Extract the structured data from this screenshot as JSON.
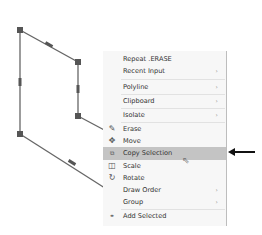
{
  "drawing": {
    "shape": "polyline-selected",
    "vertices": [
      [
        20,
        30
      ],
      [
        78,
        62
      ],
      [
        78,
        116
      ],
      [
        20,
        134
      ]
    ],
    "open_segments": [
      [
        [
          78,
          116
        ],
        [
          108,
          132
        ]
      ],
      [
        [
          20,
          134
        ],
        [
          108,
          190
        ]
      ]
    ],
    "line_color": "#666666",
    "grip_color": "#555555"
  },
  "menu": {
    "items": [
      {
        "label": "Repeat .ERASE",
        "icon": null,
        "submenu": false
      },
      {
        "label": "Recent Input",
        "icon": null,
        "submenu": true
      },
      {
        "label": "Polyline",
        "icon": null,
        "submenu": true
      },
      {
        "label": "Clipboard",
        "icon": null,
        "submenu": true
      },
      {
        "label": "Isolate",
        "icon": null,
        "submenu": true
      },
      {
        "label": "Erase",
        "icon": "eraser-icon",
        "submenu": false
      },
      {
        "label": "Move",
        "icon": "move-icon",
        "submenu": false
      },
      {
        "label": "Copy Selection",
        "icon": "copy-icon",
        "submenu": false,
        "highlighted": true
      },
      {
        "label": "Scale",
        "icon": "scale-icon",
        "submenu": false
      },
      {
        "label": "Rotate",
        "icon": "rotate-icon",
        "submenu": false
      },
      {
        "label": "Draw Order",
        "icon": null,
        "submenu": true
      },
      {
        "label": "Group",
        "icon": null,
        "submenu": true
      },
      {
        "label": "Add Selected",
        "icon": "add-selected-icon",
        "submenu": false
      }
    ],
    "submenu_glyph": "›",
    "highlight_color": "#c4c4c4"
  },
  "annotation": {
    "type": "arrow",
    "points_to": "Copy Selection"
  }
}
